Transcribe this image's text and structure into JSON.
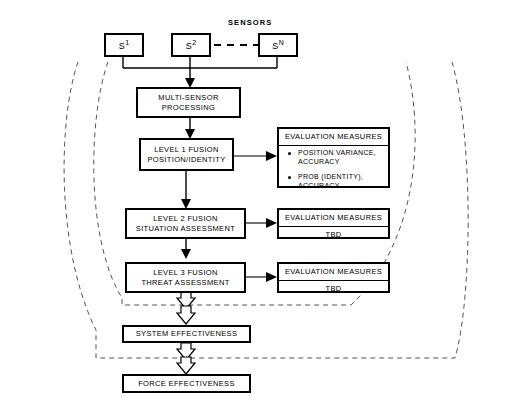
{
  "diagram": {
    "title_label": "SENSORS",
    "sensors": [
      {
        "id": "s1",
        "name": "S",
        "sup": "1"
      },
      {
        "id": "s2",
        "name": "S",
        "sup": "2"
      },
      {
        "id": "sN",
        "name": "S",
        "sup": "N"
      }
    ],
    "process_nodes": [
      {
        "id": "multi-sensor-processing",
        "line1": "MULTI-SENSOR",
        "line2": "PROCESSING"
      },
      {
        "id": "level-1-fusion",
        "line1": "LEVEL 1 FUSION",
        "line2": "POSITION/IDENTITY"
      },
      {
        "id": "level-2-fusion",
        "line1": "LEVEL 2 FUSION",
        "line2": "SITUATION ASSESSMENT"
      },
      {
        "id": "level-3-fusion",
        "line1": "LEVEL 3 FUSION",
        "line2": "THREAT ASSESSMENT"
      }
    ],
    "effectiveness_nodes": [
      {
        "id": "system-effectiveness",
        "label": "SYSTEM EFFECTIVENESS"
      },
      {
        "id": "force-effectiveness",
        "label": "FORCE EFFECTIVENESS"
      }
    ],
    "evaluation_boxes": [
      {
        "id": "eval-level-1",
        "header": "EVALUATION MEASURES",
        "bullets": [
          {
            "line1": "POSITION VARIANCE,",
            "line2": "ACCURACY"
          },
          {
            "line1": "PROB (IDENTITY),",
            "line2": "ACCURACY"
          }
        ]
      },
      {
        "id": "eval-level-2",
        "header": "EVALUATION MEASURES",
        "tbd": "TBD"
      },
      {
        "id": "eval-level-3",
        "header": "EVALUATION MEASURES",
        "tbd": "TBD"
      }
    ],
    "colors": {
      "stroke": "#000000",
      "background": "#ffffff",
      "dashed_boundary": "#555555"
    }
  }
}
